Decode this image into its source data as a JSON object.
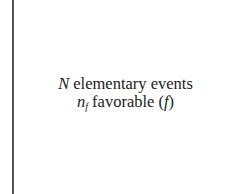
{
  "diagram": {
    "line1": {
      "symbol": "N",
      "text": " elementary events"
    },
    "line2": {
      "symbol": "n",
      "subscript": "f",
      "text": " favorable (",
      "paren_symbol": "f",
      "close": ")"
    }
  },
  "colors": {
    "line": "#555555",
    "text": "#222222",
    "background": "#ffffff"
  }
}
